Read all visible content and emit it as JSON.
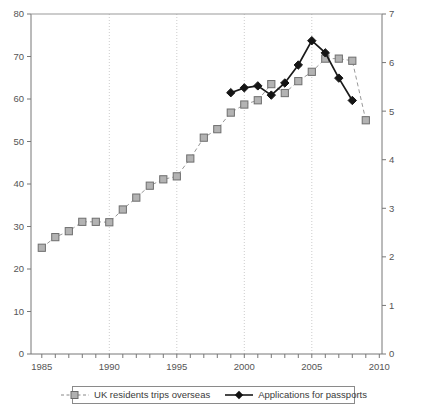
{
  "chart_data": {
    "type": "line",
    "title": "",
    "subtitle": "",
    "xlabel": "",
    "ylabel": "",
    "y2label": "",
    "x": [
      1985,
      1986,
      1987,
      1988,
      1989,
      1990,
      1991,
      1992,
      1993,
      1994,
      1995,
      1996,
      1997,
      1998,
      1999,
      2000,
      2001,
      2002,
      2003,
      2004,
      2005,
      2006,
      2007,
      2008,
      2009
    ],
    "xlim": [
      1984.2,
      2010.2
    ],
    "xticks": [
      1985,
      1986,
      1987,
      1988,
      1989,
      1990,
      1991,
      1992,
      1993,
      1994,
      1995,
      1996,
      1997,
      1998,
      1999,
      2000,
      2001,
      2002,
      2003,
      2004,
      2005,
      2006,
      2007,
      2008,
      2009,
      2010
    ],
    "xticklabels": [
      "1985",
      "1990",
      "1995",
      "2000",
      "2005",
      "2010"
    ],
    "xticklabel_values": [
      1985,
      1990,
      1995,
      2000,
      2005,
      2010
    ],
    "ylim": [
      0,
      80
    ],
    "yticks": [
      0,
      10,
      20,
      30,
      40,
      50,
      60,
      70,
      80
    ],
    "yticklabels": [
      "0",
      "10",
      "20",
      "30",
      "40",
      "50",
      "60",
      "70",
      "80"
    ],
    "y2lim": [
      0,
      7
    ],
    "y2ticks": [
      0,
      1,
      2,
      3,
      4,
      5,
      6,
      7
    ],
    "y2ticklabels": [
      "0",
      "1",
      "2",
      "3",
      "4",
      "5",
      "6",
      "7"
    ],
    "grid": "vertical dotted at 1990, 1995, 2000, 2005",
    "gridlines_x": [
      1990,
      1995,
      2000,
      2005
    ],
    "legend_position": "below axes, centered, boxed",
    "series": [
      {
        "name": "UK residents trips overseas",
        "axis": "left",
        "marker": "square",
        "linestyle": "dashed",
        "color": "#999999",
        "x": [
          1985,
          1986,
          1987,
          1988,
          1989,
          1990,
          1991,
          1992,
          1993,
          1994,
          1995,
          1996,
          1997,
          1998,
          1999,
          2000,
          2001,
          2002,
          2003,
          2004,
          2005,
          2006,
          2007,
          2008,
          2009
        ],
        "values": [
          25.0,
          27.5,
          28.9,
          31.1,
          31.1,
          31.0,
          34.0,
          36.8,
          39.6,
          41.1,
          41.8,
          46.0,
          50.9,
          52.9,
          56.8,
          58.7,
          59.7,
          63.5,
          61.4,
          64.2,
          66.4,
          69.5,
          69.5,
          69.0,
          55.0
        ]
      },
      {
        "name": "Applications for passports",
        "axis": "right",
        "marker": "diamond",
        "linestyle": "solid",
        "color": "#1a1a1a",
        "x": [
          1999,
          2000,
          2001,
          2002,
          2003,
          2004,
          2005,
          2006,
          2007,
          2008
        ],
        "values": [
          5.38,
          5.48,
          5.52,
          5.33,
          5.58,
          5.95,
          6.45,
          6.2,
          5.68,
          5.22
        ]
      }
    ]
  },
  "legend": {
    "entries": [
      {
        "label": "UK residents trips overseas",
        "marker": "square-dashed-gray"
      },
      {
        "label": "Applications for passports",
        "marker": "diamond-solid-black"
      }
    ]
  }
}
